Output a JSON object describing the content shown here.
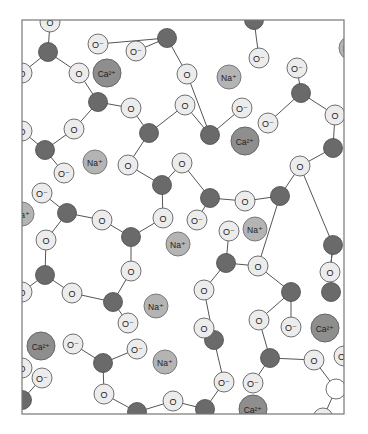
{
  "figure": {
    "page_number_fragment": "...",
    "frame": {
      "x": 22,
      "y": 20,
      "w": 322,
      "h": 394
    },
    "colors": {
      "silicon": "#6a6a6a",
      "oxygen": "#ececec",
      "sodium": "#b4b4b4",
      "calcium": "#8e8e8e",
      "bond": "#555555",
      "frame": "#777777"
    },
    "labels": {
      "O": "O",
      "O_minus": "O⁻",
      "Na": "Na⁺",
      "Ca": "Ca²⁺"
    }
  },
  "atoms": [
    {
      "id": "s1",
      "type": "Si",
      "x": 48,
      "y": 52
    },
    {
      "id": "s2",
      "type": "Si",
      "x": 98,
      "y": 102
    },
    {
      "id": "s3",
      "type": "Si",
      "x": 167,
      "y": 38
    },
    {
      "id": "s4",
      "type": "Si",
      "x": 254,
      "y": 20
    },
    {
      "id": "s5",
      "type": "Si",
      "x": 301,
      "y": 93
    },
    {
      "id": "s6",
      "type": "Si",
      "x": 149,
      "y": 133
    },
    {
      "id": "s7",
      "type": "Si",
      "x": 210,
      "y": 135
    },
    {
      "id": "s8",
      "type": "Si",
      "x": 45,
      "y": 150
    },
    {
      "id": "s9",
      "type": "Si",
      "x": 333,
      "y": 148
    },
    {
      "id": "s10",
      "type": "Si",
      "x": 162,
      "y": 185
    },
    {
      "id": "s11",
      "type": "Si",
      "x": 210,
      "y": 198
    },
    {
      "id": "s12",
      "type": "Si",
      "x": 280,
      "y": 196
    },
    {
      "id": "s13",
      "type": "Si",
      "x": 67,
      "y": 213
    },
    {
      "id": "s14",
      "type": "Si",
      "x": 131,
      "y": 237
    },
    {
      "id": "s15",
      "type": "Si",
      "x": 333,
      "y": 245
    },
    {
      "id": "s16",
      "type": "Si",
      "x": 45,
      "y": 275
    },
    {
      "id": "s17",
      "type": "Si",
      "x": 226,
      "y": 263
    },
    {
      "id": "s18",
      "type": "Si",
      "x": 113,
      "y": 302
    },
    {
      "id": "s19",
      "type": "Si",
      "x": 291,
      "y": 292
    },
    {
      "id": "s20",
      "type": "Si",
      "x": 331,
      "y": 292
    },
    {
      "id": "s21",
      "type": "Si",
      "x": 103,
      "y": 363
    },
    {
      "id": "s22",
      "type": "Si",
      "x": 270,
      "y": 358
    },
    {
      "id": "s23",
      "type": "Si",
      "x": 205,
      "y": 409
    },
    {
      "id": "s24",
      "type": "Si",
      "x": 22,
      "y": 400
    },
    {
      "id": "s25",
      "type": "Si",
      "x": 137,
      "y": 412
    },
    {
      "id": "s26",
      "type": "Si",
      "x": 214,
      "y": 340
    },
    {
      "id": "o1",
      "type": "O",
      "x": 50,
      "y": 22
    },
    {
      "id": "o2",
      "type": "O-",
      "x": 98,
      "y": 44
    },
    {
      "id": "o3",
      "type": "O-",
      "x": 136,
      "y": 51
    },
    {
      "id": "o4",
      "type": "O",
      "x": 79,
      "y": 73
    },
    {
      "id": "o5",
      "type": "O",
      "x": 22,
      "y": 73
    },
    {
      "id": "o6",
      "type": "O",
      "x": 131,
      "y": 108
    },
    {
      "id": "o7",
      "type": "O",
      "x": 74,
      "y": 129
    },
    {
      "id": "o8",
      "type": "O",
      "x": 22,
      "y": 131
    },
    {
      "id": "o9",
      "type": "O",
      "x": 187,
      "y": 74
    },
    {
      "id": "o10",
      "type": "O-",
      "x": 259,
      "y": 58
    },
    {
      "id": "o11",
      "type": "O-",
      "x": 297,
      "y": 68
    },
    {
      "id": "o12",
      "type": "O",
      "x": 335,
      "y": 115
    },
    {
      "id": "o13",
      "type": "O-",
      "x": 268,
      "y": 123
    },
    {
      "id": "o14",
      "type": "O-",
      "x": 242,
      "y": 108
    },
    {
      "id": "o15",
      "type": "O",
      "x": 185,
      "y": 105
    },
    {
      "id": "o16",
      "type": "O",
      "x": 182,
      "y": 163
    },
    {
      "id": "o17",
      "type": "O",
      "x": 128,
      "y": 165
    },
    {
      "id": "o18",
      "type": "O-",
      "x": 64,
      "y": 173
    },
    {
      "id": "o19",
      "type": "O-",
      "x": 42,
      "y": 193
    },
    {
      "id": "o20",
      "type": "O",
      "x": 300,
      "y": 166
    },
    {
      "id": "o21",
      "type": "O",
      "x": 245,
      "y": 201
    },
    {
      "id": "o22",
      "type": "O-",
      "x": 197,
      "y": 220
    },
    {
      "id": "o23",
      "type": "O",
      "x": 102,
      "y": 220
    },
    {
      "id": "o24",
      "type": "O",
      "x": 163,
      "y": 218
    },
    {
      "id": "o25",
      "type": "O",
      "x": 46,
      "y": 240
    },
    {
      "id": "o26",
      "type": "O",
      "x": 131,
      "y": 271
    },
    {
      "id": "o27",
      "type": "O",
      "x": 258,
      "y": 266
    },
    {
      "id": "o28",
      "type": "O-",
      "x": 229,
      "y": 231
    },
    {
      "id": "o29",
      "type": "O",
      "x": 72,
      "y": 293
    },
    {
      "id": "o30",
      "type": "O",
      "x": 204,
      "y": 290
    },
    {
      "id": "o31",
      "type": "O",
      "x": 330,
      "y": 272
    },
    {
      "id": "o32",
      "type": "O-",
      "x": 128,
      "y": 323
    },
    {
      "id": "o33",
      "type": "O-",
      "x": 73,
      "y": 344
    },
    {
      "id": "o34",
      "type": "O-",
      "x": 137,
      "y": 349
    },
    {
      "id": "o35",
      "type": "O",
      "x": 204,
      "y": 328
    },
    {
      "id": "o36",
      "type": "O",
      "x": 259,
      "y": 320
    },
    {
      "id": "o37",
      "type": "O-",
      "x": 291,
      "y": 327
    },
    {
      "id": "o38",
      "type": "O",
      "x": 104,
      "y": 394
    },
    {
      "id": "o39",
      "type": "O-",
      "x": 42,
      "y": 378
    },
    {
      "id": "o40",
      "type": "O",
      "x": 173,
      "y": 401
    },
    {
      "id": "o41",
      "type": "O-",
      "x": 253,
      "y": 383
    },
    {
      "id": "o41b",
      "type": "O-",
      "x": 224,
      "y": 382
    },
    {
      "id": "o42",
      "type": "O",
      "x": 314,
      "y": 360
    },
    {
      "id": "o43",
      "type": "O-",
      "x": 344,
      "y": 356
    },
    {
      "id": "o44",
      "type": "Ow",
      "x": 336,
      "y": 389
    },
    {
      "id": "o45",
      "type": "O",
      "x": 323,
      "y": 418
    },
    {
      "id": "o46",
      "type": "O",
      "x": 22,
      "y": 368
    },
    {
      "id": "o47",
      "type": "O",
      "x": 22,
      "y": 292
    },
    {
      "id": "na1",
      "type": "Na",
      "x": 351,
      "y": 48
    },
    {
      "id": "na2",
      "type": "Na",
      "x": 229,
      "y": 77
    },
    {
      "id": "na3",
      "type": "Na",
      "x": 95,
      "y": 162
    },
    {
      "id": "na4",
      "type": "Na",
      "x": 22,
      "y": 214
    },
    {
      "id": "na5",
      "type": "Na",
      "x": 178,
      "y": 244
    },
    {
      "id": "na6",
      "type": "Na",
      "x": 255,
      "y": 229
    },
    {
      "id": "na7",
      "type": "Na",
      "x": 156,
      "y": 306
    },
    {
      "id": "na8",
      "type": "Na",
      "x": 165,
      "y": 362
    },
    {
      "id": "ca1",
      "type": "Ca",
      "x": 107,
      "y": 73
    },
    {
      "id": "ca2",
      "type": "Ca",
      "x": 245,
      "y": 141
    },
    {
      "id": "ca3",
      "type": "Ca",
      "x": 325,
      "y": 328
    },
    {
      "id": "ca4",
      "type": "Ca",
      "x": 41,
      "y": 346
    },
    {
      "id": "ca5",
      "type": "Ca",
      "x": 253,
      "y": 409
    }
  ],
  "bonds": [
    [
      "s1",
      "o1"
    ],
    [
      "s1",
      "o4"
    ],
    [
      "s1",
      "o5"
    ],
    [
      "s2",
      "o4"
    ],
    [
      "s2",
      "o6"
    ],
    [
      "s2",
      "o7"
    ],
    [
      "s3",
      "o2"
    ],
    [
      "s3",
      "o3"
    ],
    [
      "s3",
      "o9"
    ],
    [
      "s4",
      "o10"
    ],
    [
      "s5",
      "o11"
    ],
    [
      "s5",
      "o12"
    ],
    [
      "s5",
      "o13"
    ],
    [
      "s6",
      "o6"
    ],
    [
      "s6",
      "o15"
    ],
    [
      "s6",
      "o17"
    ],
    [
      "s7",
      "o15"
    ],
    [
      "s7",
      "o14"
    ],
    [
      "s7",
      "o9"
    ],
    [
      "s8",
      "o7"
    ],
    [
      "s8",
      "o8"
    ],
    [
      "s8",
      "o18"
    ],
    [
      "s9",
      "o12"
    ],
    [
      "s9",
      "o20"
    ],
    [
      "s10",
      "o17"
    ],
    [
      "s10",
      "o16"
    ],
    [
      "s10",
      "o24"
    ],
    [
      "s11",
      "o16"
    ],
    [
      "s11",
      "o21"
    ],
    [
      "s11",
      "o22"
    ],
    [
      "s12",
      "o21"
    ],
    [
      "s12",
      "o20"
    ],
    [
      "s12",
      "o27"
    ],
    [
      "s13",
      "o19"
    ],
    [
      "s13",
      "o23"
    ],
    [
      "s13",
      "o25"
    ],
    [
      "s14",
      "o23"
    ],
    [
      "s14",
      "o24"
    ],
    [
      "s14",
      "o26"
    ],
    [
      "s15",
      "o20"
    ],
    [
      "s15",
      "o31"
    ],
    [
      "s16",
      "o25"
    ],
    [
      "s16",
      "o29"
    ],
    [
      "s16",
      "o47"
    ],
    [
      "s17",
      "o28"
    ],
    [
      "s17",
      "o27"
    ],
    [
      "s17",
      "o30"
    ],
    [
      "s18",
      "o26"
    ],
    [
      "s18",
      "o29"
    ],
    [
      "s18",
      "o32"
    ],
    [
      "s19",
      "o27"
    ],
    [
      "s19",
      "o36"
    ],
    [
      "s19",
      "o37"
    ],
    [
      "s21",
      "o33"
    ],
    [
      "s21",
      "o34"
    ],
    [
      "s21",
      "o38"
    ],
    [
      "s22",
      "o36"
    ],
    [
      "s22",
      "o42"
    ],
    [
      "s22",
      "o41"
    ],
    [
      "s23",
      "o40"
    ],
    [
      "s23",
      "o41b"
    ],
    [
      "s24",
      "o39"
    ],
    [
      "s25",
      "o38"
    ],
    [
      "s25",
      "o40"
    ],
    [
      "s26",
      "o30"
    ],
    [
      "s26",
      "o35"
    ],
    [
      "s26",
      "o41b"
    ],
    [
      "o42",
      "o44"
    ],
    [
      "o44",
      "o45"
    ],
    [
      "s15",
      "o31"
    ],
    [
      "o31",
      "s20"
    ]
  ]
}
